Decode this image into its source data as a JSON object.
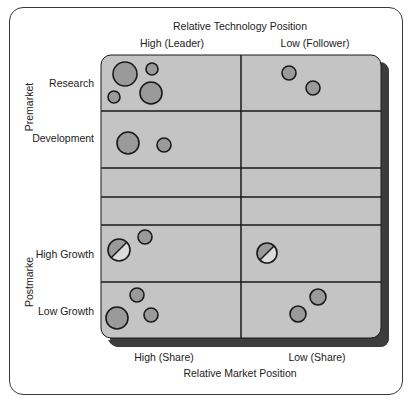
{
  "diagram": {
    "top_axis": {
      "title": "Relative Technology Position",
      "columns": [
        "High (Leader)",
        "Low (Follower)"
      ]
    },
    "bottom_axis": {
      "title": "Relative Market Position",
      "columns": [
        "High (Share)",
        "Low (Share)"
      ]
    },
    "left_groups": [
      {
        "label": "Premarket",
        "rows": [
          "Research",
          "Development"
        ]
      },
      {
        "label": "Postmarke",
        "rows": [
          "High Growth",
          "Low Growth"
        ]
      }
    ],
    "colors": {
      "board_fill": "#c4c4c4",
      "board_shadow": "#3c3c3c",
      "bubble_fill": "#9a9a9a",
      "bubble_light": "#dcdcdc",
      "line": "#1a1a1a"
    },
    "bubbles": [
      {
        "row": "Research",
        "column": "High",
        "cx": 125,
        "cy": 74,
        "r": 12,
        "type": "solid"
      },
      {
        "row": "Research",
        "column": "High",
        "cx": 152,
        "cy": 69,
        "r": 6,
        "type": "solid"
      },
      {
        "row": "Research",
        "column": "High",
        "cx": 114,
        "cy": 97,
        "r": 6,
        "type": "solid"
      },
      {
        "row": "Research",
        "column": "High",
        "cx": 151,
        "cy": 93,
        "r": 11,
        "type": "solid"
      },
      {
        "row": "Research",
        "column": "Low",
        "cx": 289,
        "cy": 73,
        "r": 7,
        "type": "solid"
      },
      {
        "row": "Research",
        "column": "Low",
        "cx": 313,
        "cy": 88,
        "r": 7,
        "type": "solid"
      },
      {
        "row": "Development",
        "column": "High",
        "cx": 128,
        "cy": 143,
        "r": 11,
        "type": "solid"
      },
      {
        "row": "Development",
        "column": "High",
        "cx": 164,
        "cy": 145,
        "r": 7,
        "type": "solid"
      },
      {
        "row": "High Growth",
        "column": "High",
        "cx": 119,
        "cy": 250,
        "r": 11,
        "type": "split"
      },
      {
        "row": "High Growth",
        "column": "High",
        "cx": 145,
        "cy": 237,
        "r": 7,
        "type": "solid"
      },
      {
        "row": "High Growth",
        "column": "Low",
        "cx": 267,
        "cy": 253,
        "r": 10,
        "type": "split"
      },
      {
        "row": "Low Growth",
        "column": "High",
        "cx": 117,
        "cy": 318,
        "r": 11,
        "type": "solid"
      },
      {
        "row": "Low Growth",
        "column": "High",
        "cx": 137,
        "cy": 295,
        "r": 7,
        "type": "solid"
      },
      {
        "row": "Low Growth",
        "column": "High",
        "cx": 151,
        "cy": 315,
        "r": 7,
        "type": "solid"
      },
      {
        "row": "Low Growth",
        "column": "Low",
        "cx": 318,
        "cy": 297,
        "r": 8,
        "type": "solid"
      },
      {
        "row": "Low Growth",
        "column": "Low",
        "cx": 298,
        "cy": 314,
        "r": 8,
        "type": "solid"
      }
    ]
  }
}
